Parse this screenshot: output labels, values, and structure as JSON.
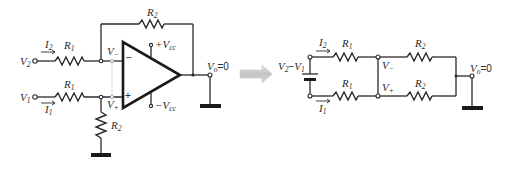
{
  "figure": {
    "left_circuit": {
      "name": "differential-amplifier",
      "inputs": [
        {
          "id": "v2",
          "label": "V",
          "sub": "2"
        },
        {
          "id": "v1",
          "label": "V",
          "sub": "1"
        }
      ],
      "currents": [
        {
          "id": "i2",
          "label": "I",
          "sub": "2"
        },
        {
          "id": "i1",
          "label": "I",
          "sub": "1"
        }
      ],
      "resistors": {
        "r1_top": {
          "label": "R",
          "sub": "1"
        },
        "r1_bottom": {
          "label": "R",
          "sub": "1"
        },
        "r2_feedback": {
          "label": "R",
          "sub": "2"
        },
        "r2_ground": {
          "label": "R",
          "sub": "2"
        }
      },
      "nodes": {
        "v_minus": {
          "label": "V",
          "sub": "−"
        },
        "v_plus": {
          "label": "V",
          "sub": "+"
        }
      },
      "opamp": {
        "inverting_sign": "−",
        "noninverting_sign": "+",
        "vcc_pos": {
          "prefix": "+V",
          "sub": "cc"
        },
        "vcc_neg": {
          "prefix": "−V",
          "sub": "cc"
        }
      },
      "output": {
        "label": "V",
        "sub": "o",
        "value": "=0"
      }
    },
    "transform_arrow": {
      "name": "right-arrow",
      "color": "#c8c8c8"
    },
    "right_circuit": {
      "name": "equivalent-network",
      "source": {
        "label_a": "V",
        "sub_a": "2",
        "minus": "−",
        "label_b": "V",
        "sub_b": "1"
      },
      "currents": [
        {
          "id": "i2",
          "label": "I",
          "sub": "2"
        },
        {
          "id": "i1",
          "label": "I",
          "sub": "1"
        }
      ],
      "resistors": {
        "r1_top": {
          "label": "R",
          "sub": "1"
        },
        "r1_bottom": {
          "label": "R",
          "sub": "1"
        },
        "r2_top": {
          "label": "R",
          "sub": "2"
        },
        "r2_bottom": {
          "label": "R",
          "sub": "2"
        }
      },
      "nodes": {
        "v_minus": {
          "label": "V",
          "sub": "−"
        },
        "v_plus": {
          "label": "V",
          "sub": "+"
        }
      },
      "output": {
        "label": "V",
        "sub": "o",
        "value": "=0"
      }
    }
  }
}
